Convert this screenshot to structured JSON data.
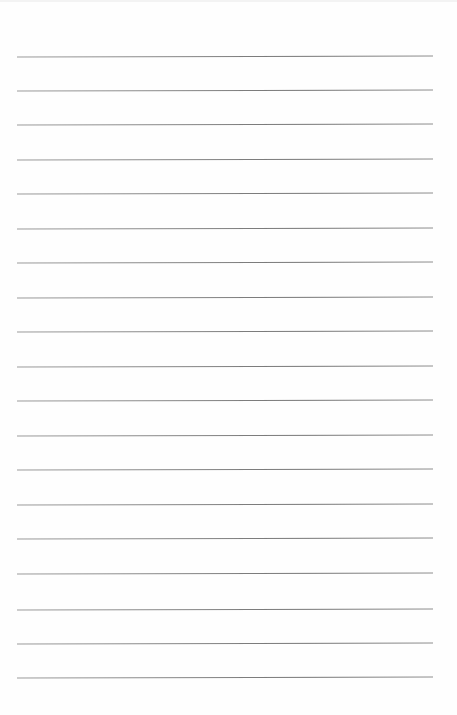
{
  "document": {
    "type": "blank lined paper",
    "background_color": "#fefefe",
    "rule_color": "#6f6f6f",
    "rule_count": 19,
    "rules_y": [
      56,
      90,
      124,
      159,
      193,
      228,
      262,
      297,
      331,
      366,
      400,
      435,
      469,
      504,
      538,
      573,
      609,
      643,
      677
    ],
    "rule_x_start": 17,
    "rule_x_end": 433,
    "text": ""
  }
}
